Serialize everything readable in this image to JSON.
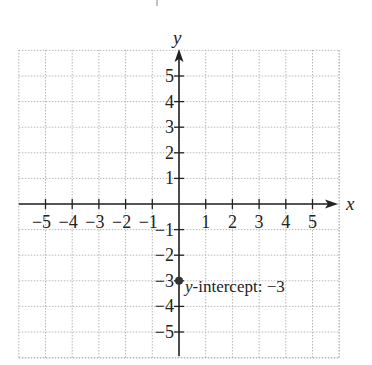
{
  "chart_data": {
    "type": "scatter",
    "title": "",
    "xlabel": "x",
    "ylabel": "y",
    "xlim": [
      -6,
      6
    ],
    "ylim": [
      -6,
      6
    ],
    "grid": true,
    "x_ticks": [
      -5,
      -4,
      -3,
      -2,
      -1,
      1,
      2,
      3,
      4,
      5
    ],
    "y_ticks": [
      5,
      4,
      3,
      2,
      1,
      -1,
      -2,
      -3,
      -4,
      -5
    ],
    "x_tick_labels": [
      "−5",
      "−4",
      "−3",
      "−2",
      "−1",
      "1",
      "2",
      "3",
      "4",
      "5"
    ],
    "y_tick_labels": [
      "5",
      "4",
      "3",
      "2",
      "1",
      "−1",
      "−2",
      "−3",
      "−4",
      "−5"
    ],
    "points": [
      {
        "x": 0,
        "y": -3
      }
    ],
    "annotations": [
      {
        "x": 0,
        "y": -3,
        "text_italic": "y",
        "text": "-intercept: −3"
      }
    ]
  },
  "labels": {
    "x_axis": "x",
    "y_axis": "y",
    "annotation_var": "y",
    "annotation_text": "-intercept: −3"
  }
}
